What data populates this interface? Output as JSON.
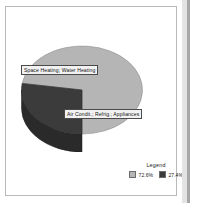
{
  "chart_data": {
    "type": "pie",
    "title": "",
    "subtitle": "",
    "xlabel": "",
    "ylabel": "",
    "three_d": true,
    "grid": false,
    "legend_position": "bottom-right",
    "legend_title": "Legend",
    "categories": [
      "Space Heating; Water Heating",
      "Air Condit.; Refrig.; Appliances"
    ],
    "values": [
      72.6,
      27.4
    ],
    "value_unit": "%",
    "slices": [
      {
        "label": "Space Heating; Water Heating",
        "value": 72.6,
        "display_value": "72.6%",
        "color": "#b5b5b5",
        "side_color": "#8d8d8d",
        "start_angle_deg": 188,
        "end_angle_deg": 90
      },
      {
        "label": "Air Condit.; Refrig.; Appliances",
        "value": 27.4,
        "display_value": "27.4%",
        "color": "#3b3b3b",
        "side_color": "#2a2a2a",
        "start_angle_deg": 90,
        "end_angle_deg": 188
      }
    ]
  },
  "pie": {
    "label_slice_0": "Space Heating; Water Heating",
    "label_slice_1": "Air Condit.; Refrig.; Appliances"
  },
  "legend": {
    "title": "Legend",
    "entries": [
      {
        "swatch": "#b5b5b5",
        "value": "72.6%"
      },
      {
        "swatch": "#3b3b3b",
        "value": "27.4%"
      }
    ],
    "entry_0_value": "72.6%",
    "entry_1_value": "27.4%"
  },
  "colors": {
    "slice_light": "#b5b5b5",
    "slice_dark": "#3b3b3b",
    "slice_light_side": "#8d8d8d",
    "slice_dark_side": "#2a2a2a",
    "frame_border": "#b9b9b9",
    "page_background": "#ffffff",
    "label_background": "#f2f2f2",
    "label_border": "#4a4a4a",
    "text": "#111111"
  }
}
